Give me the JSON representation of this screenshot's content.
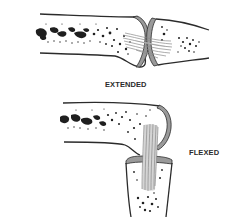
{
  "figure": {
    "panels": [
      {
        "id": "extended",
        "label": "EXTENDED"
      },
      {
        "id": "flexed",
        "label": "FLEXED"
      }
    ]
  },
  "colors": {
    "outline": "#2b2b2b",
    "cartilage": "#9a9a9a",
    "ligament": "#b8b8b8",
    "marrow": "#1f1f1f",
    "background": "#ffffff"
  }
}
